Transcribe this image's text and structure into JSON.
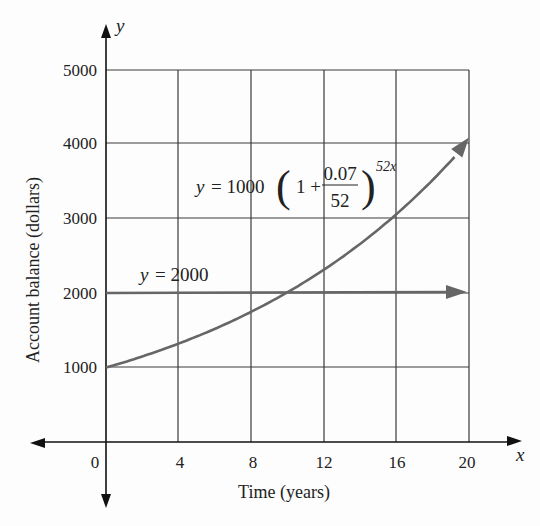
{
  "chart_data": {
    "type": "line",
    "title": "",
    "xlabel": "Time (years)",
    "ylabel": "Account balance (dollars)",
    "x_axis_var": "x",
    "y_axis_var": "y",
    "xlim": [
      0,
      20
    ],
    "ylim": [
      0,
      5000
    ],
    "x_ticks": [
      0,
      4,
      8,
      12,
      16,
      20
    ],
    "y_ticks": [
      1000,
      2000,
      3000,
      4000,
      5000
    ],
    "grid": true,
    "legend": null,
    "series": [
      {
        "name": "y = 1000(1 + 0.07/52)^(52x)",
        "label_parts": {
          "lhs": "y = 1000",
          "one_plus": "1 +",
          "numerator": "0.07",
          "denominator": "52",
          "exponent": "52x"
        },
        "kind": "curve",
        "formula": {
          "principal": 1000,
          "rate": 0.07,
          "periods_per_year": 52
        },
        "x": [
          0,
          4,
          8,
          12,
          16,
          20
        ],
        "values": [
          1000,
          1323,
          1751,
          2317,
          3066,
          4056
        ],
        "color": "#6b6b6b"
      },
      {
        "name": "y = 2000",
        "kind": "horizontal",
        "x": [
          0,
          20
        ],
        "values": [
          2000,
          2000
        ],
        "color": "#6b6b6b"
      }
    ],
    "annotations": [
      {
        "text": "y = 1000(1 + 0.07/52)^(52x)",
        "near": [
          12,
          3400
        ]
      },
      {
        "text": "y = 2000",
        "near": [
          5,
          2150
        ]
      }
    ]
  },
  "labels": {
    "y_var": "y",
    "x_var": "x",
    "xlabel": "Time (years)",
    "ylabel": "Account balance (dollars)",
    "x_ticks": [
      "0",
      "4",
      "8",
      "12",
      "16",
      "20"
    ],
    "y_ticks": [
      "1000",
      "2000",
      "3000",
      "4000",
      "5000"
    ],
    "eq_lhs_var": "y",
    "eq_lhs_rest": "= 1000",
    "eq_one_plus": "1 +",
    "eq_num": "0.07",
    "eq_den": "52",
    "eq_exp": "52x",
    "hline_var": "y",
    "hline_rest": "= 2000"
  }
}
